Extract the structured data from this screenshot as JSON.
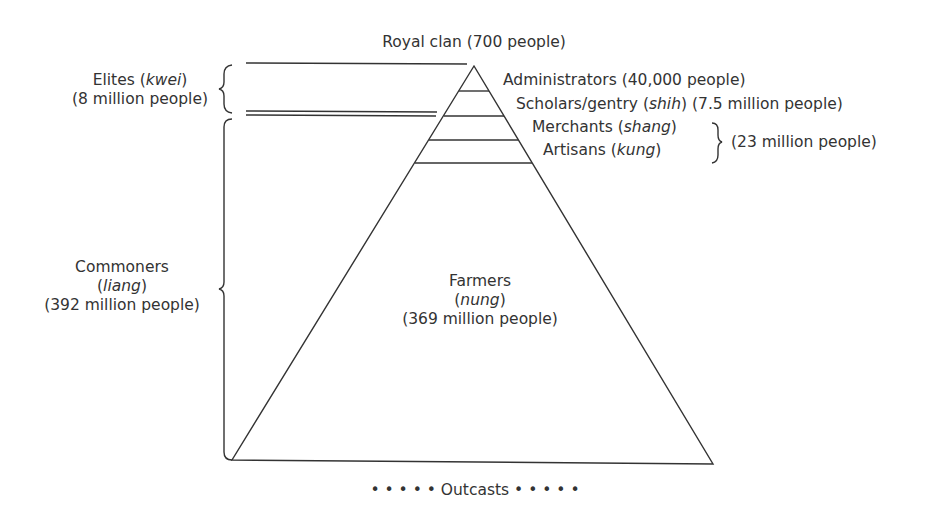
{
  "diagram": {
    "top_label": "Royal clan (700 people)",
    "layers": [
      {
        "name": "Administrators",
        "term": "",
        "pop": "(40,000 people)"
      },
      {
        "name": "Scholars/gentry",
        "term": "shih",
        "pop": "(7.5 million people)"
      },
      {
        "name": "Merchants",
        "term": "shang",
        "pop": ""
      },
      {
        "name": "Artisans",
        "term": "kung",
        "pop": ""
      },
      {
        "name": "Farmers",
        "term": "nung",
        "pop": "(369 million people)"
      }
    ],
    "merchants_artisans_group_pop": "(23 million people)",
    "groups": {
      "elites": {
        "name": "Elites",
        "term": "kwei",
        "pop": "(8 million people)"
      },
      "commoners": {
        "name": "Commoners",
        "term": "liang",
        "pop": "(392 million people)"
      }
    },
    "bottom": {
      "dots_left": "• • • • •",
      "label": "Outcasts",
      "dots_right": "• • • • •"
    },
    "paren_open": "(",
    "paren_close": ")"
  }
}
